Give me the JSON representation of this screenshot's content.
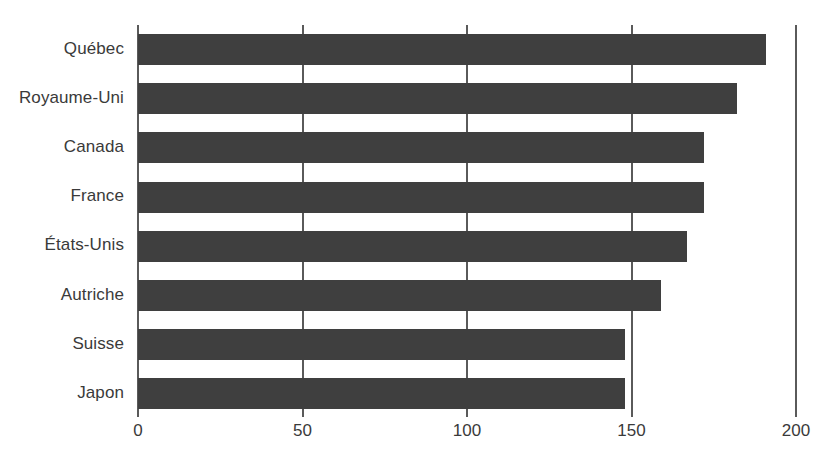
{
  "chart_data": {
    "type": "bar",
    "orientation": "horizontal",
    "title": "",
    "subtitle": "",
    "xlabel": "",
    "ylabel": "",
    "categories": [
      "Québec",
      "Royaume-Uni",
      "Canada",
      "France",
      "États-Unis",
      "Autriche",
      "Suisse",
      "Japon"
    ],
    "values": [
      191,
      182,
      172,
      172,
      167,
      159,
      148,
      148
    ],
    "xlim": [
      0,
      200
    ],
    "xticks": [
      0,
      50,
      100,
      150,
      200
    ],
    "xtick_labels": [
      "0",
      "50",
      "100",
      "150",
      "200"
    ],
    "grid": true,
    "grid_axis": "x",
    "legend": false,
    "bar_color": "#3f3f3f",
    "grid_color": "#5a5a5a",
    "text_color": "#3a3a3a",
    "background": "#ffffff"
  },
  "axis": {
    "x_ticks": [
      {
        "label": "0",
        "value": 0
      },
      {
        "label": "50",
        "value": 50
      },
      {
        "label": "100",
        "value": 100
      },
      {
        "label": "150",
        "value": 150
      },
      {
        "label": "200",
        "value": 200
      }
    ]
  },
  "bars": [
    {
      "label": "Québec",
      "value": 191
    },
    {
      "label": "Royaume-Uni",
      "value": 182
    },
    {
      "label": "Canada",
      "value": 172
    },
    {
      "label": "France",
      "value": 172
    },
    {
      "label": "États-Unis",
      "value": 167
    },
    {
      "label": "Autriche",
      "value": 159
    },
    {
      "label": "Suisse",
      "value": 148
    },
    {
      "label": "Japon",
      "value": 148
    }
  ]
}
